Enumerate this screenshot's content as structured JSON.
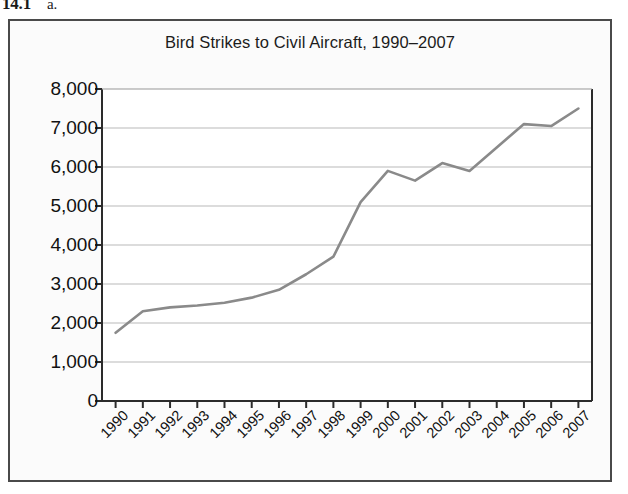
{
  "header": {
    "number": "14.1",
    "item_label": "a."
  },
  "figure": {
    "border_color": "#4a4a4a",
    "background_color": "#fbfbfb"
  },
  "chart_data": {
    "type": "line",
    "title": "Bird Strikes to Civil Aircraft, 1990–2007",
    "xlabel": "",
    "ylabel": "",
    "categories": [
      "1990",
      "1991",
      "1992",
      "1993",
      "1994",
      "1995",
      "1996",
      "1997",
      "1998",
      "1999",
      "2000",
      "2001",
      "2002",
      "2003",
      "2004",
      "2005",
      "2006",
      "2007"
    ],
    "values": [
      1750,
      2300,
      2400,
      2450,
      2520,
      2650,
      2850,
      3250,
      3700,
      5100,
      5900,
      5650,
      6100,
      5900,
      6500,
      7100,
      7050,
      7500
    ],
    "ylim": [
      0,
      8000
    ],
    "ytick_values": [
      0,
      1000,
      2000,
      3000,
      4000,
      5000,
      6000,
      7000,
      8000
    ],
    "ytick_labels": [
      "0",
      "1,000",
      "2,000",
      "3,000",
      "4,000",
      "5,000",
      "6,000",
      "7,000",
      "8,000"
    ],
    "grid": "horizontal",
    "grid_color": "#b9b9b9",
    "axis_color": "#2b2b2b",
    "line_color": "#8a8a8a",
    "line_width": 2.6,
    "markers": false,
    "legend": null,
    "legend_position": "none"
  }
}
